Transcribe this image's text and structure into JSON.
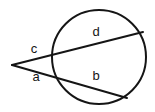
{
  "figure": {
    "background_color": "#ffffff",
    "stroke_color": "#151515",
    "stroke_width": 2,
    "label_color": "#151515",
    "width": 155,
    "height": 112
  },
  "circle": {
    "name": "circle",
    "center_x": 99,
    "center_y": 57,
    "radius": 47
  },
  "external_point": {
    "name": "vertex",
    "x": 12,
    "y": 65
  },
  "secants": [
    {
      "id": "upper-secant",
      "from_x": 12,
      "from_y": 65,
      "to_x": 143,
      "to_y": 32,
      "near_intersection_x": 56,
      "near_intersection_y": 54
    },
    {
      "id": "lower-secant",
      "from_x": 12,
      "from_y": 65,
      "to_x": 127,
      "to_y": 98,
      "near_intersection_x": 58,
      "near_intersection_y": 77
    }
  ],
  "labels": [
    {
      "id": "label-c",
      "text": "c",
      "x": 34,
      "y": 50
    },
    {
      "id": "label-a",
      "text": "a",
      "x": 36,
      "y": 78
    },
    {
      "id": "label-d",
      "text": "d",
      "x": 96,
      "y": 33
    },
    {
      "id": "label-b",
      "text": "b",
      "x": 96,
      "y": 77
    }
  ]
}
